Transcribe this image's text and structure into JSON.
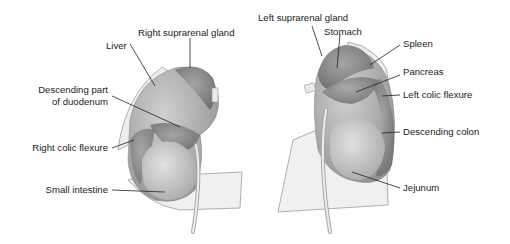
{
  "diagram": {
    "colors": {
      "organ_dark": "#8a8a8a",
      "organ_mid": "#b9b9b9",
      "organ_light": "#d9d9d9",
      "peritoneum": "#eeeeee",
      "outline": "#9a9a9a",
      "leader_line": "#222222",
      "text": "#222222"
    },
    "right_kidney": {
      "labels": {
        "right_suprarenal_gland": "Right suprarenal gland",
        "liver": "Liver",
        "descending_duodenum_line1": "Descending part",
        "descending_duodenum_line2": "of duodenum",
        "right_colic_flexure": "Right colic flexure",
        "small_intestine": "Small intestine"
      }
    },
    "left_kidney": {
      "labels": {
        "left_suprarenal_gland": "Left suprarenal gland",
        "stomach": "Stomach",
        "spleen": "Spleen",
        "pancreas": "Pancreas",
        "left_colic_flexure": "Left colic flexure",
        "descending_colon": "Descending colon",
        "jejunum": "Jejunum"
      }
    }
  }
}
